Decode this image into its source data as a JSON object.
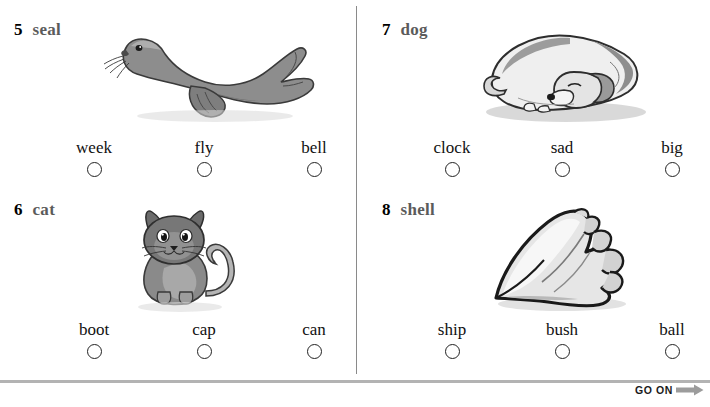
{
  "page": {
    "go_on_label": "GO ON",
    "divider_color": "#8a8a8a",
    "rule_color": "#b3b3b3",
    "arrow_color": "#9c9c9c"
  },
  "items": [
    {
      "number": "5",
      "word": "seal",
      "picture": "seal-illustration",
      "choices": [
        {
          "label": "week"
        },
        {
          "label": "fly"
        },
        {
          "label": "bell"
        }
      ]
    },
    {
      "number": "6",
      "word": "cat",
      "picture": "cat-illustration",
      "choices": [
        {
          "label": "boot"
        },
        {
          "label": "cap"
        },
        {
          "label": "can"
        }
      ]
    },
    {
      "number": "7",
      "word": "dog",
      "picture": "dog-illustration",
      "choices": [
        {
          "label": "clock"
        },
        {
          "label": "sad"
        },
        {
          "label": "big"
        }
      ]
    },
    {
      "number": "8",
      "word": "shell",
      "picture": "shell-illustration",
      "choices": [
        {
          "label": "ship"
        },
        {
          "label": "bush"
        },
        {
          "label": "ball"
        }
      ]
    }
  ]
}
